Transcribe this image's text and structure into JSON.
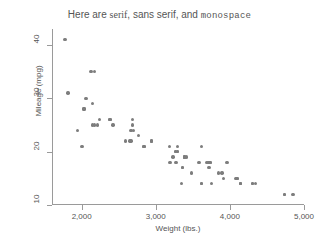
{
  "chart_data": {
    "type": "scatter",
    "title": "Here are serif, sans serif, and monospace",
    "title_parts": [
      {
        "text": "Here are ",
        "font": "sans serif"
      },
      {
        "text": "serif",
        "font": "serif"
      },
      {
        "text": ", sans serif, and ",
        "font": "sans serif"
      },
      {
        "text": "monospace",
        "font": "monospace"
      }
    ],
    "xlabel": "Weight (lbs.)",
    "ylabel": "Mileage (mpg)",
    "xlim": [
      1600,
      5000
    ],
    "ylim": [
      10,
      43
    ],
    "xticks": [
      2000,
      3000,
      4000,
      5000
    ],
    "xticklabels": [
      "2,000",
      "3,000",
      "4,000",
      "5,000"
    ],
    "yticks": [
      10,
      20,
      30,
      40
    ],
    "yticklabels": [
      "10",
      "20",
      "30",
      "40"
    ],
    "grid": false,
    "legend": "none",
    "marker_color": "#7d7d7d",
    "axis_color": "#9a9a9a",
    "background": "#ffffff",
    "n_points": 74,
    "x": [
      2930,
      3350,
      2640,
      3250,
      4080,
      3670,
      2230,
      3280,
      3880,
      3400,
      3330,
      3600,
      3600,
      3600,
      4720,
      3740,
      4840,
      4720,
      3830,
      2580,
      4060,
      3720,
      3370,
      4130,
      3720,
      3370,
      4130,
      2830,
      3370,
      2020,
      2130,
      4290,
      3350,
      3250,
      4080,
      3950,
      3470,
      3710,
      3570,
      2020,
      3260,
      2830,
      4130,
      3720,
      3370,
      2650,
      3700,
      3690,
      3180,
      3220,
      4330,
      3900,
      4290,
      2110,
      2200,
      2670,
      2370,
      2160,
      2670,
      2750,
      3170,
      2690,
      2160,
      2040,
      1930,
      1990,
      3280,
      2370,
      2130,
      2650,
      1800,
      1760,
      2050,
      2410
    ],
    "y": [
      22,
      17,
      22,
      20,
      15,
      18,
      26,
      20,
      16,
      19,
      14,
      14,
      21,
      14,
      12,
      14,
      12,
      12,
      16,
      22,
      15,
      18,
      19,
      14,
      18,
      19,
      14,
      21,
      19,
      28,
      29,
      14,
      17,
      20,
      15,
      18,
      16,
      17,
      18,
      28,
      18,
      21,
      14,
      18,
      19,
      24,
      17,
      18,
      18,
      19,
      14,
      15,
      14,
      35,
      25,
      26,
      26,
      25,
      25,
      23,
      21,
      24,
      35,
      30,
      24,
      21,
      21,
      26,
      25,
      22,
      31,
      41,
      30,
      25
    ],
    "points": [
      {
        "x": 1760,
        "y": 41
      },
      {
        "x": 1800,
        "y": 31
      },
      {
        "x": 1930,
        "y": 24
      },
      {
        "x": 1990,
        "y": 21
      },
      {
        "x": 2020,
        "y": 28
      },
      {
        "x": 2020,
        "y": 28
      },
      {
        "x": 2040,
        "y": 30
      },
      {
        "x": 2050,
        "y": 30
      },
      {
        "x": 2110,
        "y": 35
      },
      {
        "x": 2130,
        "y": 29
      },
      {
        "x": 2130,
        "y": 25
      },
      {
        "x": 2160,
        "y": 35
      },
      {
        "x": 2160,
        "y": 25
      },
      {
        "x": 2200,
        "y": 25
      },
      {
        "x": 2230,
        "y": 26
      },
      {
        "x": 2370,
        "y": 26
      },
      {
        "x": 2370,
        "y": 26
      },
      {
        "x": 2410,
        "y": 25
      },
      {
        "x": 2580,
        "y": 22
      },
      {
        "x": 2640,
        "y": 22
      },
      {
        "x": 2650,
        "y": 24
      },
      {
        "x": 2650,
        "y": 22
      },
      {
        "x": 2670,
        "y": 26
      },
      {
        "x": 2670,
        "y": 25
      },
      {
        "x": 2690,
        "y": 24
      },
      {
        "x": 2750,
        "y": 23
      },
      {
        "x": 2830,
        "y": 21
      },
      {
        "x": 2830,
        "y": 21
      },
      {
        "x": 2930,
        "y": 22
      },
      {
        "x": 3170,
        "y": 21
      },
      {
        "x": 3180,
        "y": 18
      },
      {
        "x": 3220,
        "y": 19
      },
      {
        "x": 3250,
        "y": 20
      },
      {
        "x": 3250,
        "y": 20
      },
      {
        "x": 3260,
        "y": 18
      },
      {
        "x": 3280,
        "y": 20
      },
      {
        "x": 3280,
        "y": 21
      },
      {
        "x": 3330,
        "y": 14
      },
      {
        "x": 3350,
        "y": 17
      },
      {
        "x": 3350,
        "y": 17
      },
      {
        "x": 3370,
        "y": 19
      },
      {
        "x": 3370,
        "y": 19
      },
      {
        "x": 3370,
        "y": 19
      },
      {
        "x": 3400,
        "y": 19
      },
      {
        "x": 3470,
        "y": 16
      },
      {
        "x": 3570,
        "y": 18
      },
      {
        "x": 3600,
        "y": 14
      },
      {
        "x": 3600,
        "y": 21
      },
      {
        "x": 3600,
        "y": 14
      },
      {
        "x": 3670,
        "y": 18
      },
      {
        "x": 3690,
        "y": 18
      },
      {
        "x": 3700,
        "y": 17
      },
      {
        "x": 3710,
        "y": 17
      },
      {
        "x": 3720,
        "y": 18
      },
      {
        "x": 3720,
        "y": 18
      },
      {
        "x": 3740,
        "y": 14
      },
      {
        "x": 3830,
        "y": 16
      },
      {
        "x": 3880,
        "y": 16
      },
      {
        "x": 3900,
        "y": 15
      },
      {
        "x": 3950,
        "y": 18
      },
      {
        "x": 4060,
        "y": 15
      },
      {
        "x": 4080,
        "y": 15
      },
      {
        "x": 4080,
        "y": 15
      },
      {
        "x": 4130,
        "y": 14
      },
      {
        "x": 4130,
        "y": 14
      },
      {
        "x": 4130,
        "y": 14
      },
      {
        "x": 4290,
        "y": 14
      },
      {
        "x": 4290,
        "y": 14
      },
      {
        "x": 4330,
        "y": 14
      },
      {
        "x": 4720,
        "y": 12
      },
      {
        "x": 4720,
        "y": 12
      },
      {
        "x": 4840,
        "y": 12
      },
      {
        "x": 3280,
        "y": 20
      },
      {
        "x": 2930,
        "y": 22
      }
    ]
  }
}
